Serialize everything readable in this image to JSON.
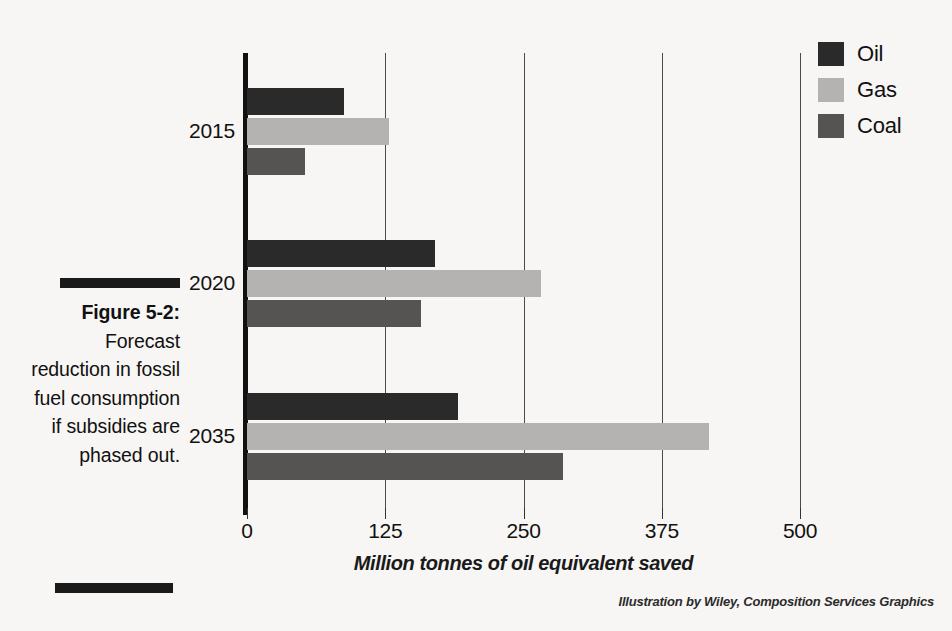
{
  "figure": {
    "caption_title": "Figure 5-2:",
    "caption_body": " Forecast reduction in fossil fuel consumption if subsidies are phased out.",
    "credit": "Illustration by Wiley, Composition Services Graphics"
  },
  "legend": {
    "items": [
      {
        "label": "Oil",
        "key": "oil",
        "color": "#2a2a2a"
      },
      {
        "label": "Gas",
        "key": "gas",
        "color": "#b4b3b1"
      },
      {
        "label": "Coal",
        "key": "coal",
        "color": "#555453"
      }
    ]
  },
  "axis": {
    "x_title": "Million tonnes of oil equivalent saved",
    "x_ticks": [
      "0",
      "125",
      "250",
      "375",
      "500"
    ],
    "y_categories": [
      "2015",
      "2020",
      "2035"
    ]
  },
  "chart_data": {
    "type": "bar",
    "orientation": "horizontal",
    "title": "Forecast reduction in fossil fuel consumption if subsidies are phased out",
    "xlabel": "Million tonnes of oil equivalent saved",
    "ylabel": "",
    "categories": [
      "2015",
      "2020",
      "2035"
    ],
    "series": [
      {
        "name": "Oil",
        "color": "#2a2a2a",
        "values": [
          88,
          170,
          191
        ]
      },
      {
        "name": "Gas",
        "color": "#b4b3b1",
        "values": [
          128,
          266,
          418
        ]
      },
      {
        "name": "Coal",
        "color": "#555453",
        "values": [
          52,
          157,
          286
        ]
      }
    ],
    "xlim": [
      0,
      500
    ],
    "xticks": [
      0,
      125,
      250,
      375,
      500
    ],
    "grid": true,
    "grid_axis": "x",
    "legend_position": "top-right"
  }
}
